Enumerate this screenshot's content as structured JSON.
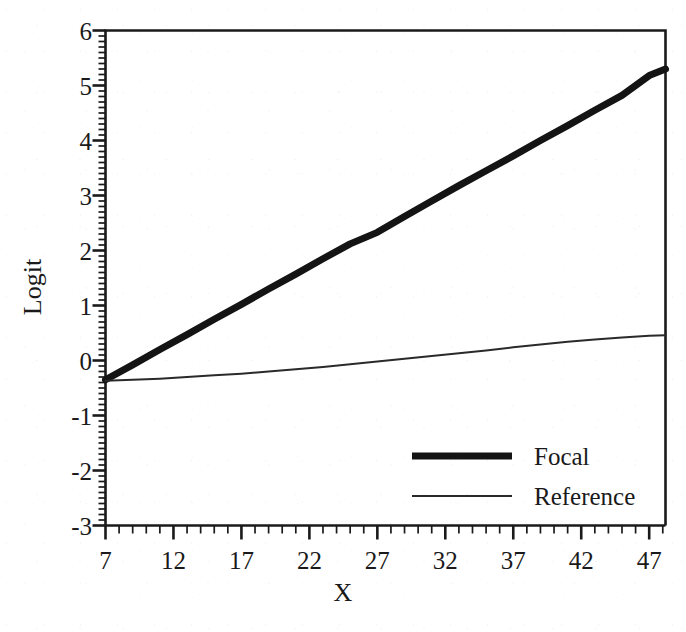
{
  "chart_data": {
    "type": "line",
    "title": "",
    "xlabel": "X",
    "ylabel": "Logit",
    "xlim": [
      7,
      48.2
    ],
    "ylim": [
      -3,
      6
    ],
    "grid": false,
    "legend_position": "inside-lower-right",
    "x_major_ticks": [
      7,
      12,
      17,
      22,
      27,
      32,
      37,
      42,
      47
    ],
    "x_tick_labels": [
      "7",
      "12",
      "17",
      "22",
      "27",
      "32",
      "37",
      "42",
      "47"
    ],
    "x_minor_tick_step": 1,
    "y_major_ticks": [
      -3,
      -2,
      -1,
      0,
      1,
      2,
      3,
      4,
      5,
      6
    ],
    "y_tick_labels": [
      "6",
      "5",
      "4",
      "3",
      "2",
      "1",
      "0",
      "-1",
      "-2",
      "-3"
    ],
    "y_minor_tick_step": 0.1,
    "series": [
      {
        "name": "Focal",
        "style": "thick-solid",
        "color": "#141414",
        "width_px": 7,
        "x": [
          7,
          9,
          11,
          13,
          15,
          17,
          19,
          21,
          23,
          25,
          27,
          29,
          31,
          33,
          35,
          37,
          39,
          41,
          43,
          45,
          47,
          48.2
        ],
        "values": [
          -0.35,
          -0.08,
          0.2,
          0.47,
          0.75,
          1.02,
          1.3,
          1.57,
          1.85,
          2.12,
          2.33,
          2.62,
          2.9,
          3.18,
          3.45,
          3.72,
          4.0,
          4.27,
          4.55,
          4.82,
          5.18,
          5.3
        ]
      },
      {
        "name": "Reference",
        "style": "thin-solid",
        "color": "#2a2a2a",
        "width_px": 2,
        "x": [
          7,
          9,
          11,
          13,
          15,
          17,
          19,
          21,
          23,
          25,
          27,
          29,
          31,
          33,
          35,
          37,
          39,
          41,
          43,
          45,
          47,
          48.2
        ],
        "values": [
          -0.37,
          -0.35,
          -0.33,
          -0.3,
          -0.27,
          -0.24,
          -0.2,
          -0.16,
          -0.12,
          -0.07,
          -0.02,
          0.03,
          0.08,
          0.13,
          0.18,
          0.24,
          0.29,
          0.34,
          0.38,
          0.42,
          0.45,
          0.46
        ]
      }
    ]
  },
  "legend": {
    "entries": [
      {
        "label": "Focal"
      },
      {
        "label": "Reference"
      }
    ]
  },
  "colors": {
    "ink": "#1a1a1a",
    "paper": "#ffffff",
    "focal": "#141414",
    "reference": "#2a2a2a"
  }
}
